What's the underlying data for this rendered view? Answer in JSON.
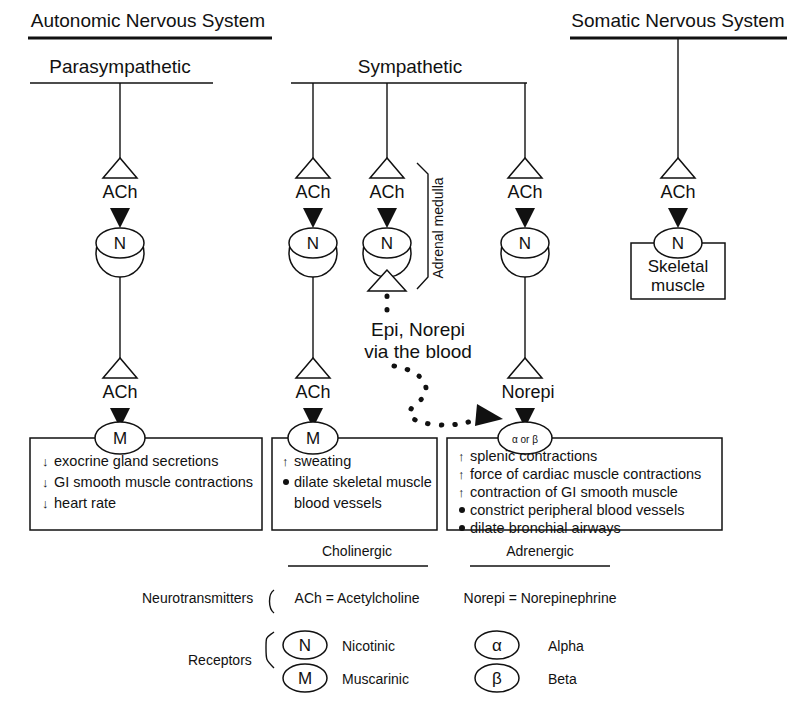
{
  "headings": {
    "autonomic": "Autonomic Nervous System",
    "somatic": "Somatic Nervous System",
    "parasympathetic": "Parasympathetic",
    "sympathetic": "Sympathetic"
  },
  "labels": {
    "ach": "ACh",
    "norepi": "Norepi",
    "adrenal_medulla": "Adrenal medulla",
    "blood_line1": "Epi, Norepi",
    "blood_line2": "via the blood",
    "skeletal_line1": "Skeletal",
    "skeletal_line2": "muscle"
  },
  "receptor_symbols": {
    "nicotinic": "N",
    "muscarinic": "M",
    "alpha": "α",
    "beta": "β",
    "alpha_or_beta_or": "or"
  },
  "effect_boxes": [
    {
      "name": "parasympathetic-effects",
      "receptor": "M",
      "items": [
        {
          "marker": "arrow",
          "text": "exocrine gland secretions"
        },
        {
          "marker": "arrow",
          "text": "GI smooth muscle contractions"
        },
        {
          "marker": "arrow",
          "text": "heart rate"
        }
      ]
    },
    {
      "name": "sympathetic-cholinergic-effects",
      "receptor": "M",
      "items": [
        {
          "marker": "arrow",
          "text": "sweating"
        },
        {
          "marker": "dot",
          "text": "dilate skeletal muscle"
        },
        {
          "marker": "none",
          "text": "blood vessels"
        }
      ]
    },
    {
      "name": "sympathetic-adrenergic-effects",
      "receptor": "α or β",
      "items": [
        {
          "marker": "arrow",
          "text": "splenic contractions"
        },
        {
          "marker": "arrow",
          "text": "force of cardiac muscle contractions"
        },
        {
          "marker": "arrow",
          "text": "contraction of GI smooth muscle"
        },
        {
          "marker": "dot",
          "text": "constrict peripheral blood vessels"
        },
        {
          "marker": "dot",
          "text": "dilate bronchial airways"
        }
      ]
    }
  ],
  "legend": {
    "column_headers": [
      "Cholinergic",
      "Adrenergic"
    ],
    "neurotransmitters_label": "Neurotransmitters",
    "receptors_label": "Receptors",
    "neurotransmitters": [
      "ACh = Acetylcholine",
      "Norepi = Norepinephrine"
    ],
    "receptors": [
      {
        "symbol": "N",
        "name": "Nicotinic"
      },
      {
        "symbol": "M",
        "name": "Muscarinic"
      },
      {
        "symbol": "α",
        "name": "Alpha"
      },
      {
        "symbol": "β",
        "name": "Beta"
      }
    ]
  },
  "colors": {
    "ink": "#111111",
    "paper": "#ffffff"
  }
}
